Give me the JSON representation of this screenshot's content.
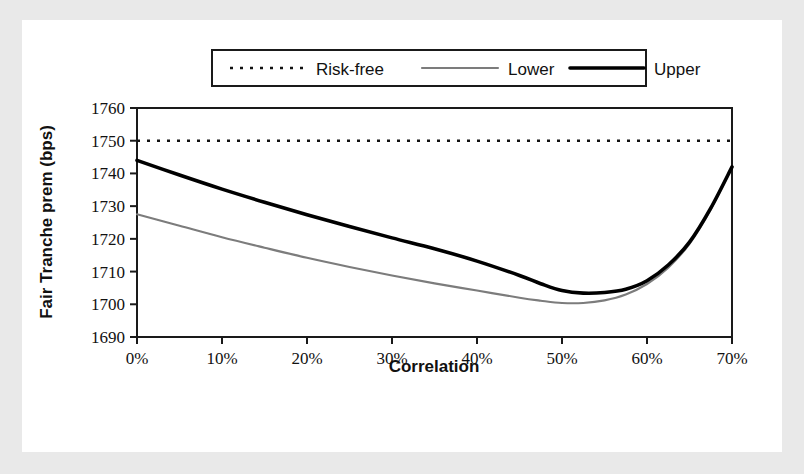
{
  "chart_data": {
    "type": "line",
    "title": "",
    "xlabel": "Correlation",
    "ylabel": "Fair Tranche prem (bps)",
    "xlim": [
      0,
      70
    ],
    "ylim": [
      1690,
      1760
    ],
    "xticks": [
      0,
      10,
      20,
      30,
      40,
      50,
      60,
      70
    ],
    "xticklabels": [
      "0%",
      "10%",
      "20%",
      "30%",
      "40%",
      "50%",
      "60%",
      "70%"
    ],
    "yticks": [
      1690,
      1700,
      1710,
      1720,
      1730,
      1740,
      1750,
      1760
    ],
    "yticklabels": [
      "1690",
      "1700",
      "1710",
      "1720",
      "1730",
      "1740",
      "1750",
      "1760"
    ],
    "grid": false,
    "legend_position": "above-plot",
    "x": [
      0,
      5,
      10,
      15,
      20,
      25,
      30,
      35,
      40,
      45,
      47.5,
      50,
      52.5,
      55,
      57.5,
      60,
      62.5,
      65,
      67.5,
      70
    ],
    "series": [
      {
        "name": "Risk-free",
        "style": "dotted",
        "color": "#121212",
        "constant": 1750,
        "values": [
          1750,
          1750,
          1750,
          1750,
          1750,
          1750,
          1750,
          1750,
          1750,
          1750,
          1750,
          1750,
          1750,
          1750,
          1750,
          1750,
          1750,
          1750,
          1750,
          1750
        ]
      },
      {
        "name": "Lower",
        "style": "solid-thin",
        "color": "#7c7c7c",
        "values": [
          1727.5,
          1724.0,
          1720.5,
          1717.3,
          1714.2,
          1711.4,
          1708.8,
          1706.4,
          1704.2,
          1702.0,
          1701.1,
          1700.4,
          1700.4,
          1701.2,
          1703.0,
          1706.2,
          1711.2,
          1718.5,
          1729.0,
          1742.0
        ]
      },
      {
        "name": "Upper",
        "style": "solid-thick",
        "color": "#000000",
        "values": [
          1744.0,
          1739.5,
          1735.2,
          1731.2,
          1727.4,
          1723.8,
          1720.3,
          1717.0,
          1713.2,
          1708.8,
          1706.3,
          1704.2,
          1703.4,
          1703.6,
          1704.6,
          1707.2,
          1712.0,
          1719.0,
          1729.4,
          1742.0
        ]
      }
    ]
  },
  "legend": {
    "entries": [
      {
        "label": "Risk-free",
        "marker": "dotted-line-swatch"
      },
      {
        "label": "Lower",
        "marker": "gray-line-swatch"
      },
      {
        "label": "Upper",
        "marker": "black-line-swatch"
      }
    ]
  },
  "axes": {
    "x_title": "Correlation",
    "y_title": "Fair Tranche prem (bps)",
    "x_tick_labels": [
      "0%",
      "10%",
      "20%",
      "30%",
      "40%",
      "50%",
      "60%",
      "70%"
    ],
    "y_tick_labels": [
      "1690",
      "1700",
      "1710",
      "1720",
      "1730",
      "1740",
      "1750",
      "1760"
    ]
  },
  "colors": {
    "upper": "#000000",
    "lower": "#7c7c7c",
    "riskfree": "#121212",
    "frame": "#e9e9e9",
    "background": "#ffffff"
  }
}
